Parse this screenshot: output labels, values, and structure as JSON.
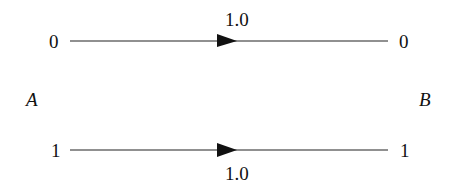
{
  "diagram": {
    "left_node": "A",
    "right_node": "B",
    "channels": [
      {
        "input": "0",
        "output": "0",
        "probability": "1.0",
        "label_position": "above"
      },
      {
        "input": "1",
        "output": "1",
        "probability": "1.0",
        "label_position": "below"
      }
    ]
  }
}
